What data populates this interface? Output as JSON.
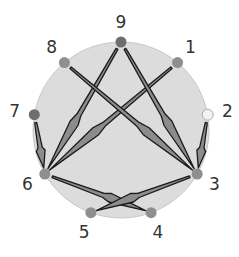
{
  "diagram": {
    "type": "circular-arrow-graph",
    "colors": {
      "circle_fill": "#dcdcdc",
      "circle_stroke": "#c8c8c8",
      "node_fill": "#8f8f8f",
      "node_highlight": "#6e6e6e",
      "node_light": "#f2f2f2",
      "arrow_fill": "#8c8c8c",
      "arrow_stroke": "#1a1a1a",
      "label": "#333333"
    },
    "nodes": [
      {
        "id": "1",
        "label": "1",
        "angle_deg": 40,
        "style": "normal"
      },
      {
        "id": "2",
        "label": "2",
        "angle_deg": 80,
        "style": "light"
      },
      {
        "id": "3",
        "label": "3",
        "angle_deg": 120,
        "style": "normal"
      },
      {
        "id": "4",
        "label": "4",
        "angle_deg": 160,
        "style": "normal"
      },
      {
        "id": "5",
        "label": "5",
        "angle_deg": 200,
        "style": "normal"
      },
      {
        "id": "6",
        "label": "6",
        "angle_deg": 240,
        "style": "normal"
      },
      {
        "id": "7",
        "label": "7",
        "angle_deg": 280,
        "style": "highlight"
      },
      {
        "id": "8",
        "label": "8",
        "angle_deg": 320,
        "style": "normal"
      },
      {
        "id": "9",
        "label": "9",
        "angle_deg": 0,
        "style": "highlight"
      }
    ],
    "edges": [
      {
        "from": "9",
        "to": "6"
      },
      {
        "from": "1",
        "to": "6"
      },
      {
        "from": "8",
        "to": "3"
      },
      {
        "from": "9",
        "to": "3"
      },
      {
        "from": "2",
        "to": "3"
      },
      {
        "from": "7",
        "to": "6"
      },
      {
        "from": "6",
        "to": "4"
      },
      {
        "from": "3",
        "to": "5"
      }
    ]
  }
}
